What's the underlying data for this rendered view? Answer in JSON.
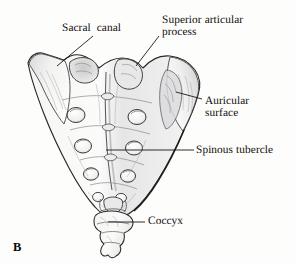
{
  "figure": {
    "letter": "B",
    "background_color": "#fdfdfb",
    "ink_color": "#100d0c",
    "shade_color": "#9a9a9c",
    "leader_color": "#1a1718"
  },
  "labels": [
    {
      "id": "sacral-canal",
      "lines": [
        "Sacral  canal"
      ],
      "leader": {
        "x1": 93,
        "y1": 36,
        "x2": 57,
        "y2": 66
      }
    },
    {
      "id": "superior-articular-process",
      "lines": [
        "Superior articular",
        "process"
      ],
      "leader": {
        "x1": 159,
        "y1": 36,
        "x2": 136,
        "y2": 66
      }
    },
    {
      "id": "auricular-surface",
      "lines": [
        "Auricular",
        "surface"
      ],
      "leader": {
        "x1": 202,
        "y1": 99,
        "x2": 176,
        "y2": 92
      }
    },
    {
      "id": "spinous-tubercle",
      "lines": [
        "Spinous tubercle"
      ],
      "leader": {
        "x1": 194,
        "y1": 150,
        "x2": 106,
        "y2": 150
      }
    },
    {
      "id": "coccyx",
      "lines": [
        "Coccyx"
      ],
      "leader": {
        "x1": 145,
        "y1": 222,
        "x2": 108,
        "y2": 222
      }
    }
  ]
}
